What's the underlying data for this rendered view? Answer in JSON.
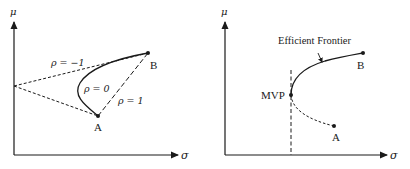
{
  "left_panel": {
    "y_axis_label": "μ",
    "x_axis_label": "σ",
    "point_a": "A",
    "point_b": "B",
    "curves": [
      {
        "label": "ρ = −1",
        "style": "dashed"
      },
      {
        "label": "ρ = 0",
        "style": "solid"
      },
      {
        "label": "ρ = 1",
        "style": "dashed"
      }
    ]
  },
  "right_panel": {
    "y_axis_label": "μ",
    "x_axis_label": "σ",
    "point_a": "A",
    "point_b": "B",
    "mvp_label": "MVP",
    "frontier_label": "Efficient Frontier"
  },
  "colors": {
    "line": "#1a1a1a",
    "background": "#ffffff"
  }
}
